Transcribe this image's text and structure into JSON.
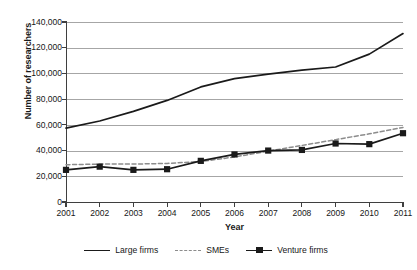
{
  "chart_data": {
    "type": "line",
    "title": "",
    "xlabel": "Year",
    "ylabel": "Number of researchers",
    "categories": [
      "2001",
      "2002",
      "2003",
      "2004",
      "2005",
      "2006",
      "2007",
      "2008",
      "2009",
      "2010",
      "2011"
    ],
    "x": [
      2001,
      2002,
      2003,
      2004,
      2005,
      2006,
      2007,
      2008,
      2009,
      2010,
      2011
    ],
    "xlim": [
      2001,
      2011
    ],
    "ylim": [
      0,
      140000
    ],
    "yticks": [
      0,
      20000,
      40000,
      60000,
      80000,
      100000,
      120000,
      140000
    ],
    "ytick_labels": [
      "0",
      "20,000",
      "40,000",
      "60,000",
      "80,000",
      "100,000",
      "120,000",
      "140,000"
    ],
    "grid": true,
    "legend_position": "bottom",
    "series": [
      {
        "name": "Large firms",
        "style": "solid",
        "marker": "none",
        "color": "#1a1a1a",
        "values": [
          57500,
          63000,
          70500,
          79000,
          89500,
          96000,
          99500,
          102500,
          105000,
          115000,
          131000
        ]
      },
      {
        "name": "SMEs",
        "style": "dashed",
        "marker": "none",
        "color": "#8c8c8c",
        "values": [
          29000,
          29500,
          29500,
          30000,
          31500,
          35000,
          39500,
          44000,
          48500,
          53000,
          58000
        ]
      },
      {
        "name": "Venture firms",
        "style": "solid",
        "marker": "square",
        "color": "#1a1a1a",
        "values": [
          25000,
          27500,
          25000,
          25500,
          32000,
          37000,
          40000,
          40500,
          45500,
          45000,
          53500
        ]
      }
    ]
  },
  "legend": {
    "items": [
      {
        "label": "Large firms",
        "swatch": "solid-line"
      },
      {
        "label": "SMEs",
        "swatch": "dashed-line"
      },
      {
        "label": "Venture firms",
        "swatch": "solid-line-square-marker"
      }
    ]
  }
}
